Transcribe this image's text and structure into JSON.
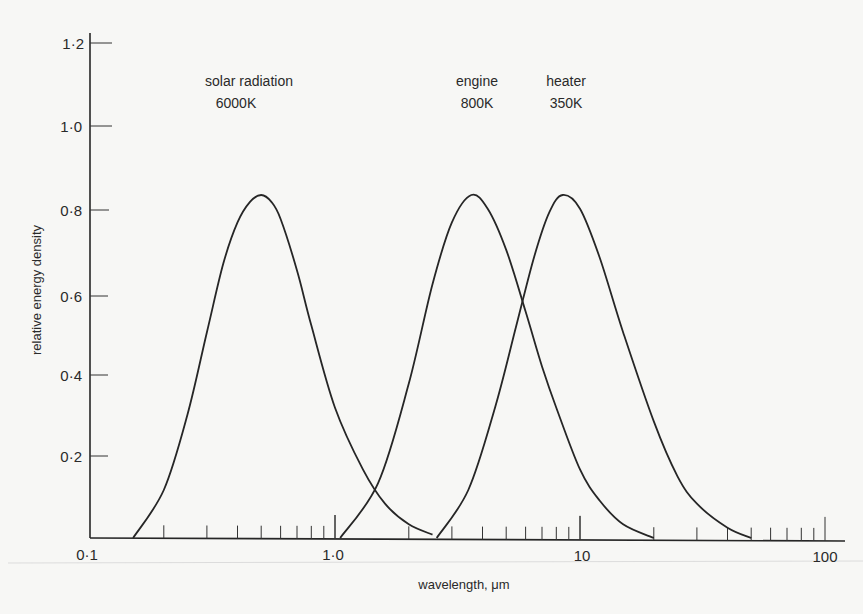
{
  "chart_data": {
    "type": "line",
    "title": "",
    "xlabel": "wavelength, μm",
    "ylabel": "relative energy density",
    "xscale": "log",
    "xlim": [
      0.1,
      120
    ],
    "ylim": [
      0,
      1.2
    ],
    "grid": false,
    "legend": "inline labels above peaks",
    "x_ticks": [
      {
        "value": 0.1,
        "label": "0·1"
      },
      {
        "value": 1.0,
        "label": "1·0"
      },
      {
        "value": 10,
        "label": "10"
      },
      {
        "value": 100,
        "label": "100"
      }
    ],
    "y_ticks": [
      {
        "value": 0.2,
        "label": "0·2"
      },
      {
        "value": 0.4,
        "label": "0·4"
      },
      {
        "value": 0.6,
        "label": "0·6"
      },
      {
        "value": 0.8,
        "label": "0·8"
      },
      {
        "value": 1.0,
        "label": "1·0"
      },
      {
        "value": 1.2,
        "label": "1·2"
      }
    ],
    "series": [
      {
        "name": "solar radiation",
        "temperature": "6000K",
        "peak_wavelength_um": 0.5,
        "peak_value": 1.0,
        "x": [
          0.15,
          0.2,
          0.25,
          0.3,
          0.35,
          0.4,
          0.45,
          0.5,
          0.55,
          0.6,
          0.7,
          0.8,
          1.0,
          1.3,
          1.6,
          2.0,
          2.5
        ],
        "y": [
          0.0,
          0.14,
          0.36,
          0.6,
          0.8,
          0.92,
          0.98,
          1.0,
          0.98,
          0.93,
          0.78,
          0.62,
          0.38,
          0.2,
          0.1,
          0.04,
          0.01
        ]
      },
      {
        "name": "engine",
        "temperature": "800K",
        "peak_wavelength_um": 3.6,
        "peak_value": 1.0,
        "x": [
          1.05,
          1.5,
          2.0,
          2.5,
          3.0,
          3.6,
          4.2,
          5.0,
          6.0,
          7.0,
          8.0,
          10,
          12,
          15,
          20
        ],
        "y": [
          0.0,
          0.16,
          0.45,
          0.74,
          0.92,
          1.0,
          0.96,
          0.84,
          0.66,
          0.5,
          0.38,
          0.2,
          0.11,
          0.04,
          0.0
        ]
      },
      {
        "name": "heater",
        "temperature": "350K",
        "peak_wavelength_um": 8.5,
        "peak_value": 1.0,
        "x": [
          2.6,
          3.5,
          4.5,
          5.5,
          6.5,
          7.5,
          8.5,
          10,
          12,
          15,
          20,
          25,
          30,
          40,
          50
        ],
        "y": [
          0.0,
          0.14,
          0.38,
          0.62,
          0.82,
          0.95,
          1.0,
          0.96,
          0.82,
          0.6,
          0.34,
          0.18,
          0.1,
          0.03,
          0.0
        ]
      }
    ]
  },
  "labels": {
    "solar_name": "solar radiation",
    "solar_temp": "6000K",
    "engine_name": "engine",
    "engine_temp": "800K",
    "heater_name": "heater",
    "heater_temp": "350K",
    "x_axis_title": "wavelength, μm",
    "y_axis_title": "relative energy density",
    "x_tick_0": "0·1",
    "x_tick_1": "1·0",
    "x_tick_2": "10",
    "x_tick_3": "100",
    "y_tick_02": "0·2",
    "y_tick_04": "0·4",
    "y_tick_06": "0·6",
    "y_tick_08": "0·8",
    "y_tick_10": "1·0",
    "y_tick_12": "1·2"
  },
  "colors": {
    "background": "#f7f7f5",
    "ink": "#262626"
  }
}
